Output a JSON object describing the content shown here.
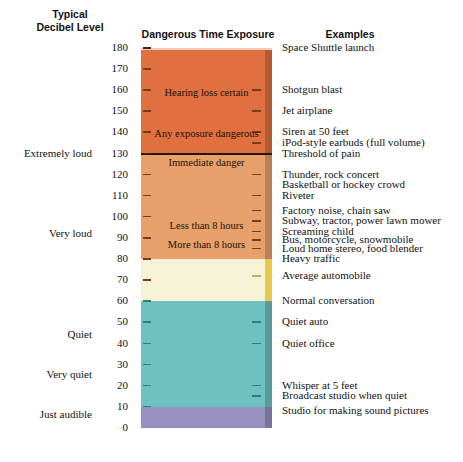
{
  "headings": {
    "typical_line1": "Typical",
    "typical_line2": "Decibel Level",
    "exposure": "Dangerous Time Exposure",
    "examples": "Examples"
  },
  "chart_data": {
    "type": "bar",
    "xlabel": "",
    "ylabel": "Decibel Level (dB)",
    "ylim": [
      0,
      180
    ],
    "grid": false,
    "legend": "none",
    "orientation": "vertical-scale",
    "axis_ticks": [
      0,
      10,
      20,
      30,
      40,
      50,
      60,
      70,
      80,
      90,
      100,
      110,
      120,
      130,
      140,
      150,
      160,
      170,
      180
    ],
    "bands": [
      {
        "name": "extremely-loud",
        "from_db": 130,
        "to_db": 180,
        "color": "#E0703F"
      },
      {
        "name": "very-loud",
        "from_db": 80,
        "to_db": 130,
        "color": "#E8A06A"
      },
      {
        "name": "moderate",
        "from_db": 60,
        "to_db": 80,
        "color": "#F5F2D5"
      },
      {
        "name": "quiet",
        "from_db": 10,
        "to_db": 60,
        "color": "#6FC0C0"
      },
      {
        "name": "just-audible",
        "from_db": 0,
        "to_db": 10,
        "color": "#9890C0"
      }
    ],
    "divider_line_db": 130,
    "exposure_labels": [
      {
        "text": "Hearing loss certain",
        "db": 158
      },
      {
        "text": "Any exposure dangerous",
        "db": 139
      },
      {
        "text": "Immediate danger",
        "db": 125
      },
      {
        "text": "Less than 8 hours",
        "db": 95
      },
      {
        "text": "More than 8 hours",
        "db": 86
      }
    ],
    "category_labels": [
      {
        "text": "Extremely loud",
        "db": 130
      },
      {
        "text": "Very loud",
        "db": 92
      },
      {
        "text": "Quiet",
        "db": 44
      },
      {
        "text": "Very quiet",
        "db": 25
      },
      {
        "text": "Just audible",
        "db": 6
      }
    ],
    "examples": [
      {
        "text": "Space Shuttle launch",
        "db": 180
      },
      {
        "text": "Shotgun blast",
        "db": 160
      },
      {
        "text": "Jet airplane",
        "db": 150
      },
      {
        "text": "Siren at 50 feet",
        "db": 140
      },
      {
        "text": "iPod-style earbuds (full volume)",
        "db": 135
      },
      {
        "text": "Threshold of pain",
        "db": 130
      },
      {
        "text": "Thunder, rock concert",
        "db": 120
      },
      {
        "text": "Basketball or hockey crowd",
        "db": 115
      },
      {
        "text": "Riveter",
        "db": 110
      },
      {
        "text": "Factory noise, chain saw",
        "db": 103
      },
      {
        "text": "Subway, tractor, power lawn mower",
        "db": 98
      },
      {
        "text": "Screaming child",
        "db": 93
      },
      {
        "text": "Bus, motorcycle, snowmobile",
        "db": 89
      },
      {
        "text": "Loud home stereo, food blender",
        "db": 85
      },
      {
        "text": "Heavy traffic",
        "db": 80
      },
      {
        "text": "Average automobile",
        "db": 72
      },
      {
        "text": "Normal conversation",
        "db": 60
      },
      {
        "text": "Quiet auto",
        "db": 50
      },
      {
        "text": "Quiet office",
        "db": 40
      },
      {
        "text": "Whisper at 5 feet",
        "db": 20
      },
      {
        "text": "Broadcast studio when quiet",
        "db": 15
      },
      {
        "text": "Studio for making sound pictures",
        "db": 8
      }
    ]
  },
  "colors": {
    "extremely_loud": "#E0703F",
    "very_loud": "#E8A06A",
    "moderate": "#F5F2D5",
    "quiet": "#6FC0C0",
    "just_audible": "#9890C0",
    "divider": "#23160D",
    "accent_gold": "#E8C84A"
  }
}
